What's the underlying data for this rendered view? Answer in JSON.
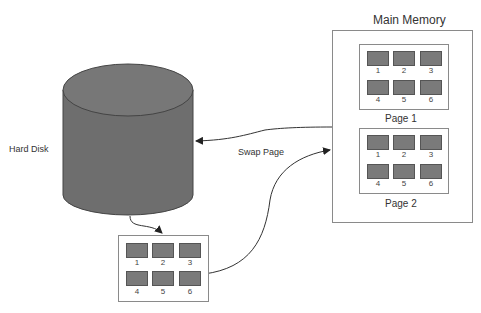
{
  "diagram": {
    "hard_disk": {
      "label": "Hard Disk"
    },
    "main_memory": {
      "title": "Main Memory",
      "pages": [
        {
          "label": "Page 1",
          "cells": [
            "1",
            "2",
            "3",
            "4",
            "5",
            "6"
          ]
        },
        {
          "label": "Page 2",
          "cells": [
            "1",
            "2",
            "3",
            "4",
            "5",
            "6"
          ]
        }
      ]
    },
    "disk_page": {
      "cells": [
        "1",
        "2",
        "3",
        "4",
        "5",
        "6"
      ]
    },
    "swap_label": "Swap Page",
    "colors": {
      "cylinder": "#6f6f6f",
      "cell": "#7a7a7a",
      "border": "#8a8a8a",
      "line": "#333333"
    }
  }
}
